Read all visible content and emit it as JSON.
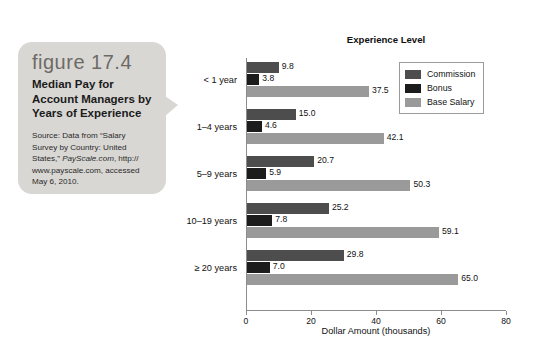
{
  "caption": {
    "figure_number": "figure 17.4",
    "title": "Median Pay for Account Managers by Years of Experience",
    "source_line1": "Source: Data from “Salary",
    "source_line2": "Survey by Country: United",
    "source_line3_pre": "States,” ",
    "source_line3_ital": "PayScale.com",
    "source_line3_post": ", http://",
    "source_line4": "www.payscale.com, accessed",
    "source_line5": "May 6, 2010."
  },
  "legend": {
    "items": [
      {
        "label": "Commission",
        "color": "#4d4d4d"
      },
      {
        "label": "Bonus",
        "color": "#1c1c1c"
      },
      {
        "label": "Base Salary",
        "color": "#9a9a9a"
      }
    ]
  },
  "chart_data": {
    "type": "bar",
    "orientation": "horizontal",
    "title": "Experience Level",
    "xlabel": "Dollar Amount (thousands)",
    "ylabel": "",
    "xlim": [
      0,
      80
    ],
    "xticks": [
      0,
      20,
      40,
      60,
      80
    ],
    "xtick_labels": [
      "0",
      "20",
      "40",
      "60",
      "80"
    ],
    "grid": false,
    "legend_position": "top-right",
    "categories": [
      "< 1 year",
      "1–4 years",
      "5–9 years",
      "10–19 years",
      "≥ 20 years"
    ],
    "series": [
      {
        "name": "Commission",
        "color": "#4d4d4d",
        "values": [
          9.8,
          15.0,
          20.7,
          25.2,
          29.8
        ],
        "labels": [
          "9.8",
          "15.0",
          "20.7",
          "25.2",
          "29.8"
        ]
      },
      {
        "name": "Bonus",
        "color": "#1c1c1c",
        "values": [
          3.8,
          4.6,
          5.9,
          7.8,
          7.0
        ],
        "labels": [
          "3.8",
          "4.6",
          "5.9",
          "7.8",
          "7.0"
        ]
      },
      {
        "name": "Base Salary",
        "color": "#9a9a9a",
        "values": [
          37.5,
          42.1,
          50.3,
          59.1,
          65.0
        ],
        "labels": [
          "37.5",
          "42.1",
          "50.3",
          "59.1",
          "65.0"
        ]
      }
    ]
  }
}
